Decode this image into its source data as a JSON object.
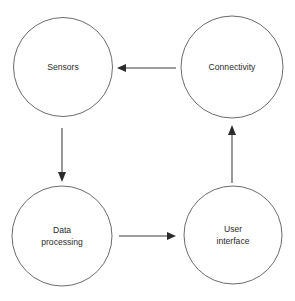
{
  "diagram": {
    "background_color": "#ffffff",
    "node_stroke_color": "#5a5a5a",
    "node_fill_color": "#ffffff",
    "edge_color": "#3c3c3c",
    "text_color": "#2b2b2b",
    "nodes": [
      {
        "id": "sensors",
        "label": "Sensors",
        "lines": [
          "Sensors"
        ],
        "shape": "circle",
        "cx": 63,
        "cy": 67,
        "r": 49.5
      },
      {
        "id": "connectivity",
        "label": "Connectivity",
        "lines": [
          "Connectivity"
        ],
        "shape": "circle",
        "cx": 232,
        "cy": 67,
        "r": 51
      },
      {
        "id": "data-processing",
        "label": "Data processing",
        "lines": [
          "Data",
          "processing"
        ],
        "shape": "circle",
        "cx": 62,
        "cy": 236,
        "r": 50
      },
      {
        "id": "user-interface",
        "label": "User interface",
        "lines": [
          "User",
          "interface"
        ],
        "shape": "circle",
        "cx": 233,
        "cy": 235,
        "r": 49
      }
    ],
    "edges": [
      {
        "id": "connectivity-to-sensors",
        "from": "connectivity",
        "to": "sensors",
        "direction": "left",
        "x1": 176,
        "y1": 68,
        "x2": 119,
        "y2": 68
      },
      {
        "id": "sensors-to-data-processing",
        "from": "sensors",
        "to": "data-processing",
        "direction": "down",
        "x1": 62,
        "y1": 128,
        "x2": 62,
        "y2": 179
      },
      {
        "id": "data-processing-to-user-interface",
        "from": "data-processing",
        "to": "user-interface",
        "direction": "right",
        "x1": 119,
        "y1": 236,
        "x2": 176,
        "y2": 236
      },
      {
        "id": "user-interface-to-connectivity",
        "from": "user-interface",
        "to": "connectivity",
        "direction": "up",
        "x1": 232,
        "y1": 183,
        "x2": 232,
        "y2": 126
      }
    ]
  }
}
